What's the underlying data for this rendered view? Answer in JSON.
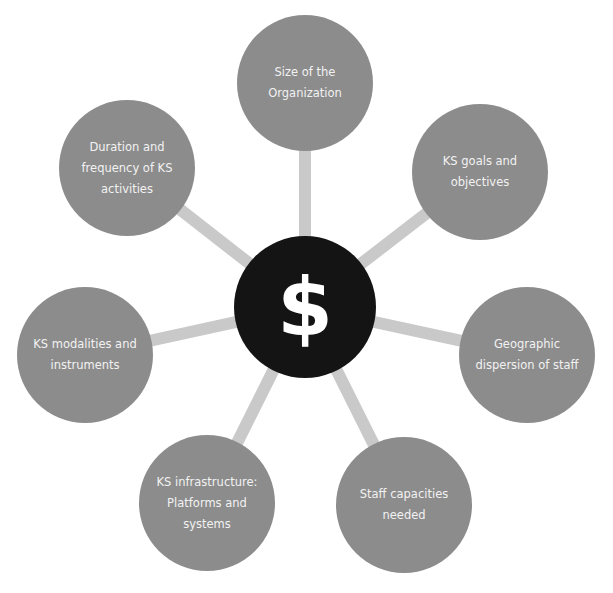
{
  "diagram": {
    "colors": {
      "background": "#ffffff",
      "node_fill": "#8c8c8c",
      "node_text": "#f2f2f2",
      "spoke": "#c9c9c9",
      "hub_fill": "#141414",
      "hub_text": "#ffffff"
    },
    "hub": {
      "symbol": "$",
      "icon": "dollar-sign-icon",
      "cx": 305,
      "cy": 307
    },
    "nodes": [
      {
        "label": "Size of the Organization",
        "cx": 305,
        "cy": 83
      },
      {
        "label": "KS goals and objectives",
        "cx": 480,
        "cy": 172
      },
      {
        "label": "Geographic dispersion of staff",
        "cx": 527,
        "cy": 355
      },
      {
        "label": "Staff capacities needed",
        "cx": 404,
        "cy": 505
      },
      {
        "label": "KS infrastructure: Platforms and systems",
        "cx": 207,
        "cy": 503
      },
      {
        "label": "KS modalities and instruments",
        "cx": 85,
        "cy": 355
      },
      {
        "label": "Duration and frequency of KS activities",
        "cx": 127,
        "cy": 168
      }
    ]
  }
}
